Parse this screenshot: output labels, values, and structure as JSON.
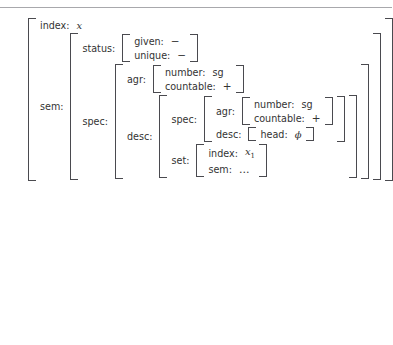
{
  "figure": {
    "type": "attribute-value-matrix",
    "attributes": {
      "index": "index:",
      "sem": "sem:",
      "status": "status:",
      "given": "given:",
      "unique": "unique:",
      "spec": "spec:",
      "agr": "agr:",
      "number": "number:",
      "countable": "countable:",
      "desc": "desc:",
      "head": "head:",
      "set": "set:"
    },
    "values": {
      "index_x": "x",
      "given_minus": "−",
      "unique_minus": "−",
      "number_sg": "sg",
      "countable_plus": "+",
      "head_phi": "ϕ",
      "index_x1_base": "x",
      "index_x1_sub": "1",
      "sem_ellipsis": "…"
    }
  },
  "colors": {
    "text": "#333333",
    "bracket": "#4a4a4f",
    "rule": "#a8a8ac",
    "background": "#ffffff"
  }
}
